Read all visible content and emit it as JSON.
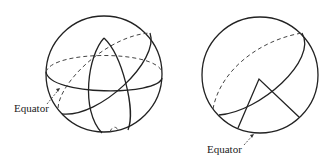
{
  "figure": {
    "panels": [
      {
        "id": "left-sphere",
        "label": "Equator",
        "description": "Sphere with equator, a tilted great circle and a spherical lune"
      },
      {
        "id": "right-sphere",
        "label": "Equator",
        "description": "Sphere with a tilted great circle and a spherical triangle touching the equator"
      }
    ],
    "colors": {
      "stroke": "#222222",
      "background": "#ffffff"
    }
  }
}
